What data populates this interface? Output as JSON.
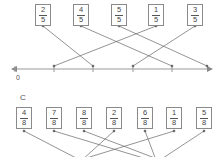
{
  "section_b": {
    "cards": [
      {
        "num": "2",
        "den": "5",
        "x": 35
      },
      {
        "num": "4",
        "den": "5",
        "x": 73
      },
      {
        "num": "5",
        "den": "5",
        "x": 111
      },
      {
        "num": "1",
        "den": "5",
        "x": 148
      },
      {
        "num": "3",
        "den": "5",
        "x": 187
      }
    ],
    "axis_zero_label": "0"
  },
  "section_c": {
    "label": "C",
    "cards": [
      {
        "num": "4",
        "den": "8",
        "x": 16
      },
      {
        "num": "7",
        "den": "8",
        "x": 46
      },
      {
        "num": "8",
        "den": "8",
        "x": 76
      },
      {
        "num": "2",
        "den": "8",
        "x": 106
      },
      {
        "num": "6",
        "den": "8",
        "x": 137
      },
      {
        "num": "1",
        "den": "8",
        "x": 166
      },
      {
        "num": "5",
        "den": "8",
        "x": 196
      }
    ]
  },
  "colors": {
    "line": "#666666",
    "axis": "#999999"
  }
}
